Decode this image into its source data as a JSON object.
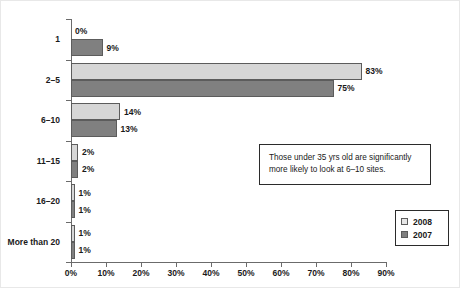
{
  "chart_data": {
    "type": "bar",
    "orientation": "horizontal",
    "title": "",
    "subtitle": "",
    "xlabel": "",
    "ylabel": "",
    "xlim": [
      0,
      90
    ],
    "grid": false,
    "categories": [
      "1",
      "2–5",
      "6–10",
      "11–15",
      "16–20",
      "More than 20"
    ],
    "series": [
      {
        "name": "2008",
        "color": "#d6d6d6",
        "values": [
          0,
          83,
          14,
          2,
          1,
          1
        ],
        "value_labels": [
          "0%",
          "83%",
          "14%",
          "2%",
          "1%",
          "1%"
        ]
      },
      {
        "name": "2007",
        "color": "#808080",
        "values": [
          9,
          75,
          13,
          2,
          1,
          1
        ],
        "value_labels": [
          "9%",
          "75%",
          "13%",
          "2%",
          "1%",
          "1%"
        ]
      }
    ],
    "xticks": [
      0,
      10,
      20,
      30,
      40,
      50,
      60,
      70,
      80,
      90
    ],
    "xtick_labels": [
      "0%",
      "10%",
      "20%",
      "30%",
      "40%",
      "50%",
      "60%",
      "70%",
      "80%",
      "90%"
    ],
    "legend": {
      "position": "bottom-right",
      "entries": [
        {
          "label": "2008",
          "swatch": "light"
        },
        {
          "label": "2007",
          "swatch": "dark"
        }
      ]
    },
    "annotations": [
      {
        "name": "insight-callout",
        "line1": "Those under 35 yrs old are significantly",
        "line2": "more likely to look at 6–10 sites."
      }
    ]
  },
  "colors": {
    "series_2008": "#d6d6d6",
    "series_2007": "#808080",
    "axis": "#6b6b6b",
    "text": "#1a1a1a",
    "bar_stroke": "#5c5c5c",
    "box_stroke": "#2b2b2b",
    "background": "#ffffff"
  }
}
